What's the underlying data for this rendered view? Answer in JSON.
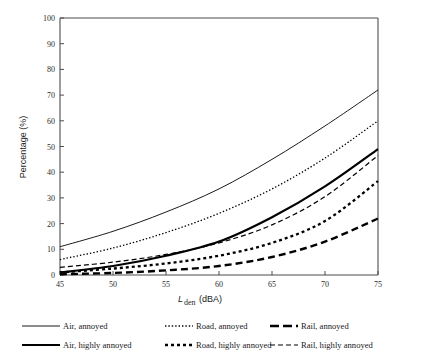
{
  "chart_data": {
    "type": "line",
    "title": "",
    "subtitle": "",
    "xlabel": "Lden (dBA)",
    "xlabel_base": "L",
    "xlabel_sub": "den",
    "xlabel_unit": "(dBA)",
    "ylabel": "Percentage (%)",
    "xlim": [
      45,
      75
    ],
    "ylim": [
      0,
      100
    ],
    "xticks": [
      45,
      50,
      55,
      60,
      65,
      70,
      75
    ],
    "yticks": [
      0,
      10,
      20,
      30,
      40,
      50,
      60,
      70,
      80,
      90,
      100
    ],
    "grid": false,
    "legend_position": "below",
    "x": [
      45,
      50,
      55,
      60,
      65,
      70,
      75
    ],
    "series": [
      {
        "name": "Air, annoyed",
        "style": "thin-solid",
        "color": "#000000",
        "values": [
          11.0,
          17.0,
          24.5,
          33.5,
          45.0,
          58.0,
          72.0
        ]
      },
      {
        "name": "Air, highly annoyed",
        "style": "thick-solid",
        "color": "#000000",
        "values": [
          1.0,
          3.5,
          7.5,
          13.0,
          22.5,
          34.5,
          49.0
        ]
      },
      {
        "name": "Road, annoyed",
        "style": "fine-dotted",
        "color": "#000000",
        "values": [
          6.0,
          10.5,
          16.5,
          24.0,
          33.5,
          45.5,
          60.0
        ]
      },
      {
        "name": "Road, highly annoyed",
        "style": "thick-dotted",
        "color": "#000000",
        "values": [
          1.0,
          2.5,
          4.5,
          7.5,
          12.5,
          21.0,
          36.5
        ]
      },
      {
        "name": "Rail, annoyed",
        "style": "thin-dashed",
        "color": "#000000",
        "values": [
          3.0,
          5.0,
          8.0,
          12.5,
          19.5,
          30.5,
          46.5
        ]
      },
      {
        "name": "Rail, highly annoyed",
        "style": "thick-dashed",
        "color": "#000000",
        "values": [
          0.3,
          0.8,
          1.8,
          3.5,
          7.0,
          13.0,
          22.0
        ]
      }
    ]
  },
  "axes": {
    "y_title": "Percentage (%)",
    "y_tick_labels": [
      "100",
      "90",
      "80",
      "70",
      "60",
      "50",
      "40",
      "30",
      "20",
      "10",
      "0"
    ],
    "x_tick_labels": [
      "45",
      "50",
      "55",
      "60",
      "65",
      "70",
      "75"
    ],
    "x_title_base": "L",
    "x_title_sub": "den",
    "x_title_unit": "(dBA)"
  },
  "legend": {
    "items": [
      {
        "label": "Air, annoyed",
        "style": "thin-solid"
      },
      {
        "label": "Road, annoyed",
        "style": "fine-dotted"
      },
      {
        "label": "Rail, annoyed",
        "style": "thick-dashed-long"
      },
      {
        "label": "Air, highly annoyed",
        "style": "thick-solid"
      },
      {
        "label": "Road, highly annoyed",
        "style": "thick-dotted"
      },
      {
        "label": "Rail, highly annoyed",
        "style": "thin-dashed"
      }
    ]
  }
}
